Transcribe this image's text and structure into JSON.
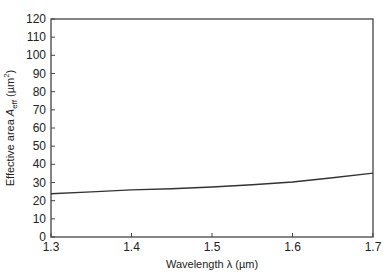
{
  "chart_data": {
    "type": "line",
    "title": "",
    "xlabel": "Wavelength λ (µm)",
    "ylabel": "Effective area A_eff (µm²)",
    "ylabel_parts": {
      "prefix": "Effective area ",
      "symbol": "A",
      "subscript": "eff",
      "unit_open": " (µm",
      "unit_sup": "2",
      "unit_close": ")"
    },
    "xlim": [
      1.3,
      1.7
    ],
    "ylim": [
      0,
      120
    ],
    "xticks": [
      1.3,
      1.4,
      1.5,
      1.6,
      1.7
    ],
    "xtick_labels": [
      "1.3",
      "1.4",
      "1.5",
      "1.6",
      "1.7"
    ],
    "yticks": [
      0,
      10,
      20,
      30,
      40,
      50,
      60,
      70,
      80,
      90,
      100,
      110,
      120
    ],
    "ytick_labels": [
      "0",
      "10",
      "20",
      "30",
      "40",
      "50",
      "60",
      "70",
      "80",
      "90",
      "100",
      "110",
      "120"
    ],
    "grid": false,
    "legend": null,
    "series": [
      {
        "name": "A_eff",
        "color": "#333333",
        "x": [
          1.3,
          1.35,
          1.4,
          1.45,
          1.5,
          1.55,
          1.6,
          1.65,
          1.7
        ],
        "values": [
          23.8,
          24.8,
          25.9,
          26.6,
          27.5,
          28.8,
          30.3,
          32.6,
          35.2
        ]
      }
    ]
  }
}
